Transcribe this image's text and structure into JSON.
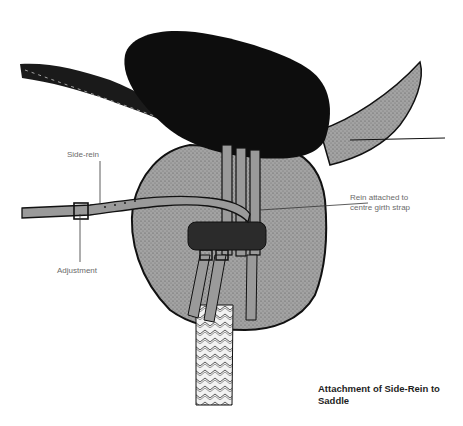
{
  "figure": {
    "caption_line1": "Attachment of Side-Rein to",
    "caption_line2": "Saddle"
  },
  "labels": {
    "side_rein": "Side-rein",
    "adjustment": "Adjustment",
    "rein_attached_line1": "Rein attached to",
    "rein_attached_line2": "centre girth strap"
  },
  "colors": {
    "background": "#ffffff",
    "leather_fill": "#9a9a9a",
    "seat_fill": "#0d0d0d",
    "outline": "#111111",
    "label_text": "#6b6b6b"
  }
}
